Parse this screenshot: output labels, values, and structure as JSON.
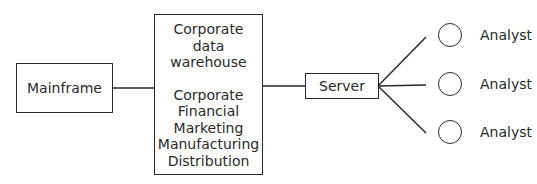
{
  "diagram": {
    "mainframe": {
      "label": "Mainframe"
    },
    "warehouse": {
      "title_lines": [
        "Corporate",
        "data",
        "warehouse"
      ],
      "content_lines": [
        "Corporate",
        "Financial",
        "Marketing",
        "Manufacturing",
        "Distribution"
      ]
    },
    "server": {
      "label": "Server"
    },
    "analysts": [
      {
        "label": "Analyst"
      },
      {
        "label": "Analyst"
      },
      {
        "label": "Analyst"
      }
    ],
    "colors": {
      "stroke": "#2a2a2a",
      "background": "#ffffff"
    }
  }
}
